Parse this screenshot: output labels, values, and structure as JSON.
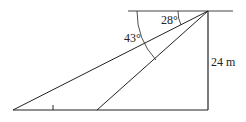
{
  "diagram": {
    "type": "angle-of-depression",
    "labels": {
      "angle_small": "28°",
      "angle_large": "43°",
      "height": "24 m"
    },
    "colors": {
      "line": "#222222",
      "horizontal_top": "#555555"
    }
  }
}
